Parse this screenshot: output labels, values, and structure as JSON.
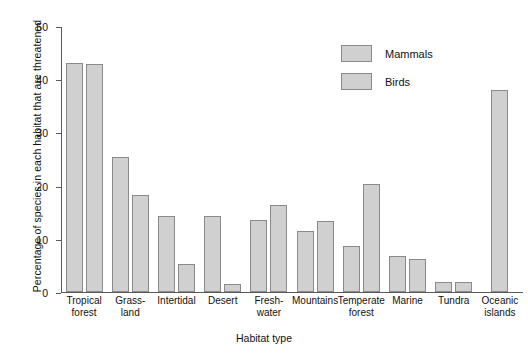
{
  "chart_data": {
    "type": "bar",
    "title": "",
    "xlabel": "Habitat type",
    "ylabel": "Percentage of species in each habitat that are threatened",
    "categories": [
      "Tropical\nforest",
      "Grass-\nland",
      "Intertidal",
      "Desert",
      "Fresh-\nwater",
      "Mountains",
      "Temperate\nforest",
      "Marine",
      "Tundra",
      "Oceanic\nislands"
    ],
    "series": [
      {
        "name": "Mammals",
        "values": [
          43.0,
          25.4,
          14.3,
          14.3,
          13.6,
          11.5,
          8.7,
          6.7,
          1.9,
          null
        ]
      },
      {
        "name": "Birds",
        "values": [
          42.9,
          18.2,
          5.2,
          1.5,
          16.3,
          13.3,
          20.3,
          6.2,
          1.9,
          37.9
        ]
      }
    ],
    "ylim": [
      0,
      50
    ],
    "yticks": [
      0,
      10,
      20,
      30,
      40,
      50
    ],
    "ytick_labels": [
      "0",
      "10",
      "20",
      "30",
      "40",
      "50"
    ],
    "grid": false,
    "legend_position": "top-right",
    "bar_fill_color": "#d0d0d0",
    "bar_edge_color": "#8a8a8a",
    "axis_color": "#5a5a5a"
  },
  "legend": {
    "entries": [
      {
        "label": "Mammals"
      },
      {
        "label": "Birds"
      }
    ]
  }
}
